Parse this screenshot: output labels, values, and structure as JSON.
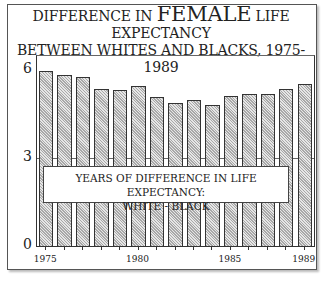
{
  "title": {
    "line1_pre": "DIFFERENCE IN ",
    "line1_big": "FEMALE",
    "line1_post": " LIFE EXPECTANCY",
    "line2": "BETWEEN WHITES AND BLACKS, 1975-1989"
  },
  "legend": {
    "line1": "YEARS OF DIFFERENCE IN LIFE EXPECTANCY:",
    "line2": "WHITE - BLACK"
  },
  "y_ticks": [
    "0",
    "3",
    "6"
  ],
  "x_tick_labels": [
    "1975",
    "1980",
    "1985",
    "1989"
  ],
  "colors": {
    "bar_fill": "#c8c8c8",
    "bar_border": "#333333",
    "frame": "#555555"
  },
  "chart_data": {
    "type": "bar",
    "title": "DIFFERENCE IN FEMALE LIFE EXPECTANCY BETWEEN WHITES AND BLACKS, 1975-1989",
    "xlabel": "",
    "ylabel": "",
    "categories": [
      "1975",
      "1976",
      "1977",
      "1978",
      "1979",
      "1980",
      "1981",
      "1982",
      "1983",
      "1984",
      "1985",
      "1986",
      "1987",
      "1988",
      "1989"
    ],
    "series": [
      {
        "name": "Years of difference in life expectancy: White - Black",
        "values": [
          6.0,
          5.85,
          5.8,
          5.4,
          5.35,
          5.5,
          5.1,
          4.9,
          5.0,
          4.85,
          5.15,
          5.2,
          5.2,
          5.4,
          5.55
        ]
      }
    ],
    "ylim": [
      0,
      6
    ],
    "yticks": [
      0,
      3,
      6
    ],
    "xticks_labeled": [
      "1975",
      "1980",
      "1985",
      "1989"
    ],
    "grid": false,
    "legend_position": "inside-center-lower"
  }
}
